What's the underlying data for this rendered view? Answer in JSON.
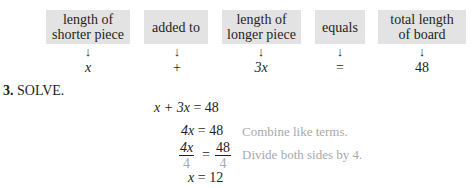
{
  "diagram": {
    "boxes": [
      {
        "label_line1": "length of",
        "label_line2": "shorter piece",
        "value": "x"
      },
      {
        "label_line1": "added to",
        "label_line2": "",
        "value": "+"
      },
      {
        "label_line1": "length of",
        "label_line2": "longer piece",
        "value": "3x"
      },
      {
        "label_line1": "equals",
        "label_line2": "",
        "value": "="
      },
      {
        "label_line1": "total length",
        "label_line2": "of board",
        "value": "48"
      }
    ],
    "arrow": "↓"
  },
  "step": {
    "number": "3.",
    "title": "SOLVE."
  },
  "equations": [
    {
      "lhs": "x + 3x",
      "eq": "=",
      "rhs": "48",
      "note": ""
    },
    {
      "lhs": "4x",
      "eq": "=",
      "rhs": "48",
      "note": "Combine like terms."
    },
    {
      "lhs_num": "4x",
      "lhs_den": "4",
      "eq": "=",
      "rhs_num": "48",
      "rhs_den": "4",
      "note": "Divide both sides by 4."
    },
    {
      "lhs": "x",
      "eq": "=",
      "rhs": "12",
      "note": ""
    }
  ]
}
